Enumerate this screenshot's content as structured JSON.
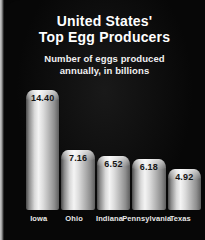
{
  "panel": {
    "background_color": "#070707",
    "bar_color": "#e6e6e6",
    "text_color": "#ffffff"
  },
  "title": {
    "line1": "United States'",
    "line2": "Top Egg Producers"
  },
  "subtitle": {
    "line1": "Number of eggs produced",
    "line2": "annually, in billions"
  },
  "chart_data": {
    "type": "bar",
    "title": "United States' Top Egg Producers",
    "subtitle": "Number of eggs produced annually, in billions",
    "xlabel": "",
    "ylabel": "Number of eggs produced annually, in billions",
    "categories": [
      "Iowa",
      "Ohio",
      "Indiana",
      "Pennsylvania",
      "Texas"
    ],
    "values": [
      14.4,
      7.16,
      6.52,
      6.18,
      4.92
    ],
    "value_labels": [
      "14.40",
      "7.16",
      "6.52",
      "6.18",
      "4.92"
    ],
    "ylim": [
      0,
      14.4
    ],
    "grid": false,
    "legend": null,
    "orientation": "vertical",
    "bar_style": "3d-cylinder-metallic"
  }
}
